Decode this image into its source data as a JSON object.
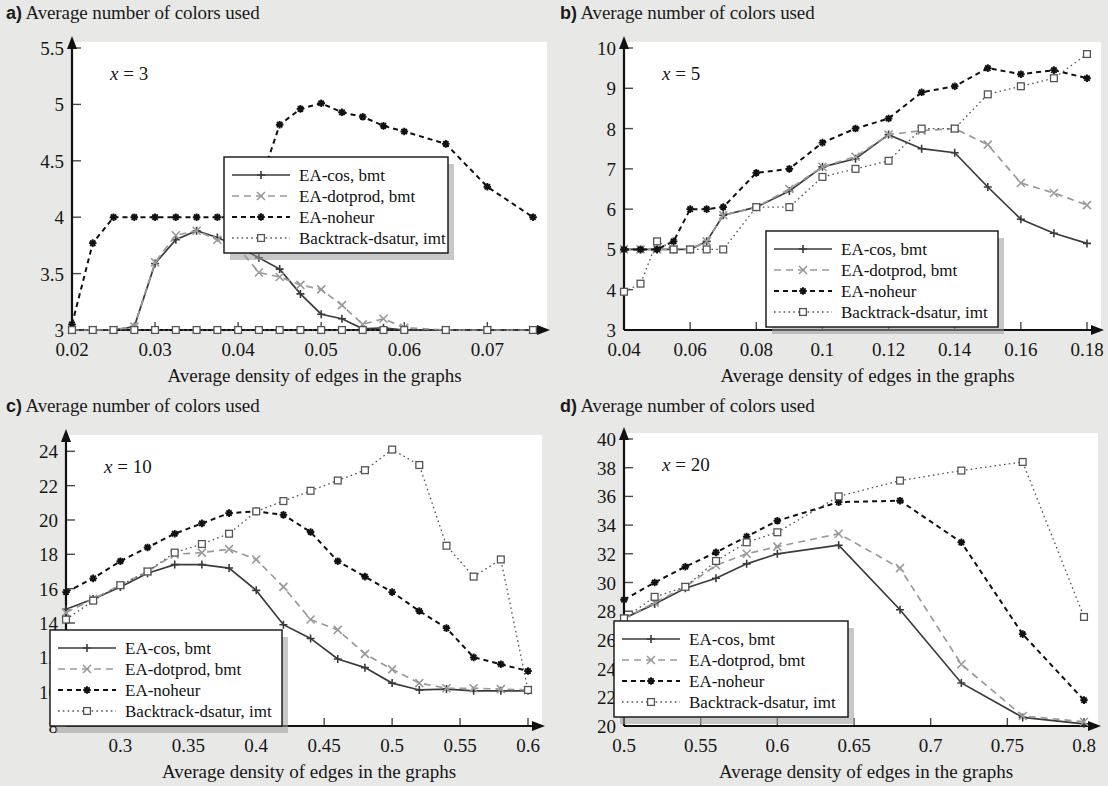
{
  "figure": {
    "background_color": "#e8e8e6",
    "plot_background_color": "#ffffff",
    "axis_caption": "Average density of edges in the graphs",
    "panel_title": "Average number of colors used"
  },
  "series_style": {
    "ea_cos": {
      "label": "EA-cos, bmt",
      "color": "#3b3b3b",
      "marker": "plus",
      "dash": "solid"
    },
    "ea_dotprod": {
      "label": "EA-dotprod, bmt",
      "color": "#9a9a9a",
      "marker": "cross",
      "dash": "dashed"
    },
    "ea_noheur": {
      "label": "EA-noheur",
      "color": "#111111",
      "marker": "asterisk",
      "dash": "dashed"
    },
    "backtrack": {
      "label": "Backtrack-dsatur, imt",
      "color": "#555555",
      "marker": "square",
      "dash": "dotted"
    }
  },
  "panels": [
    {
      "letter": "a)",
      "title": "Average number of colors used",
      "annotation": "x = 3",
      "annotation_var": "x",
      "annotation_val": "= 3"
    },
    {
      "letter": "b)",
      "title": "Average number of colors used",
      "annotation": "x = 5",
      "annotation_var": "x",
      "annotation_val": "= 5"
    },
    {
      "letter": "c)",
      "title": "Average number of colors used",
      "annotation": "x = 10",
      "annotation_var": "x",
      "annotation_val": "= 10"
    },
    {
      "letter": "d)",
      "title": "Average number of colors used",
      "annotation": "x = 20",
      "annotation_var": "x",
      "annotation_val": "= 20"
    }
  ],
  "chart_data": [
    {
      "panel": "a)",
      "type": "line",
      "title": "Average number of colors used",
      "annotation": "x = 3",
      "xlabel": "Average density of edges in the graphs",
      "ylabel": "Average number of colors used",
      "xlim": [
        0.02,
        0.0755
      ],
      "ylim": [
        3,
        5.5
      ],
      "xticks": [
        0.02,
        0.03,
        0.04,
        0.05,
        0.06,
        0.07
      ],
      "xticklabels": [
        "0.02",
        "0.03",
        "0.04",
        "0.05",
        "0.06",
        "0.07"
      ],
      "yticks": [
        3,
        3.5,
        4,
        4.5,
        5,
        5.5
      ],
      "yticklabels": [
        "3",
        "3.5",
        "4",
        "4.5",
        "5",
        "5.5"
      ],
      "grid": false,
      "legend_position": "center-right",
      "series": [
        {
          "name": "EA-cos, bmt",
          "x": [
            0.02,
            0.0225,
            0.025,
            0.0275,
            0.03,
            0.0325,
            0.035,
            0.0375,
            0.04,
            0.0425,
            0.045,
            0.0475,
            0.05,
            0.0525,
            0.055,
            0.0575,
            0.06,
            0.065,
            0.07,
            0.0755
          ],
          "values": [
            3.0,
            3.0,
            3.0,
            3.03,
            3.59,
            3.8,
            3.88,
            3.82,
            3.74,
            3.64,
            3.54,
            3.32,
            3.14,
            3.1,
            3.01,
            3.02,
            3.0,
            3.0,
            3.0,
            3.0
          ]
        },
        {
          "name": "EA-dotprod, bmt",
          "x": [
            0.02,
            0.0225,
            0.025,
            0.0275,
            0.03,
            0.0325,
            0.035,
            0.0375,
            0.04,
            0.0425,
            0.045,
            0.0475,
            0.05,
            0.0525,
            0.055,
            0.0575,
            0.06,
            0.065,
            0.07,
            0.0755
          ],
          "values": [
            3.0,
            3.0,
            3.0,
            3.03,
            3.6,
            3.84,
            3.88,
            3.8,
            3.73,
            3.51,
            3.47,
            3.4,
            3.36,
            3.22,
            3.05,
            3.1,
            3.02,
            3.0,
            3.0,
            3.0
          ]
        },
        {
          "name": "EA-noheur",
          "x": [
            0.02,
            0.0225,
            0.025,
            0.0275,
            0.03,
            0.0325,
            0.035,
            0.0375,
            0.04,
            0.0425,
            0.045,
            0.0475,
            0.05,
            0.0525,
            0.055,
            0.0575,
            0.06,
            0.065,
            0.07,
            0.0755
          ],
          "values": [
            3.05,
            3.77,
            4.0,
            4.0,
            4.0,
            4.0,
            4.0,
            4.0,
            4.0,
            4.27,
            4.82,
            4.96,
            5.01,
            4.93,
            4.89,
            4.81,
            4.76,
            4.65,
            4.27,
            4.0
          ]
        },
        {
          "name": "Backtrack-dsatur, imt",
          "x": [
            0.02,
            0.0225,
            0.025,
            0.0275,
            0.03,
            0.0325,
            0.035,
            0.0375,
            0.04,
            0.0425,
            0.045,
            0.0475,
            0.05,
            0.0525,
            0.055,
            0.0575,
            0.06,
            0.065,
            0.07,
            0.0755
          ],
          "values": [
            3.0,
            3.0,
            3.0,
            3.0,
            3.0,
            3.0,
            3.0,
            3.0,
            3.0,
            3.0,
            3.0,
            3.0,
            3.0,
            3.0,
            3.0,
            3.0,
            3.0,
            3.0,
            3.0,
            3.0
          ]
        }
      ],
      "extra_noheur_tail": {
        "x": [
          0.0755
        ],
        "values": [
          3.82
        ]
      }
    },
    {
      "panel": "b)",
      "type": "line",
      "title": "Average number of colors used",
      "annotation": "x = 5",
      "xlabel": "Average density of edges in the graphs",
      "ylabel": "Average number of colors used",
      "xlim": [
        0.04,
        0.18
      ],
      "ylim": [
        3,
        10
      ],
      "xticks": [
        0.04,
        0.06,
        0.08,
        0.1,
        0.12,
        0.14,
        0.16,
        0.18
      ],
      "xticklabels": [
        "0.04",
        "0.06",
        "0.08",
        "0.1",
        "0.12",
        "0.14",
        "0.16",
        "0.18"
      ],
      "yticks": [
        3,
        4,
        5,
        6,
        7,
        8,
        9,
        10
      ],
      "yticklabels": [
        "3",
        "4",
        "5",
        "6",
        "7",
        "8",
        "9",
        "10"
      ],
      "grid": false,
      "legend_position": "bottom-right",
      "series": [
        {
          "name": "EA-cos, bmt",
          "x": [
            0.04,
            0.045,
            0.05,
            0.055,
            0.06,
            0.065,
            0.07,
            0.08,
            0.09,
            0.1,
            0.11,
            0.12,
            0.13,
            0.14,
            0.15,
            0.16,
            0.17,
            0.18
          ],
          "values": [
            5.0,
            5.0,
            5.0,
            5.0,
            5.0,
            5.2,
            5.85,
            6.05,
            6.45,
            7.05,
            7.25,
            7.85,
            7.5,
            7.4,
            6.55,
            5.75,
            5.4,
            5.15
          ]
        },
        {
          "name": "EA-dotprod, bmt",
          "x": [
            0.04,
            0.045,
            0.05,
            0.055,
            0.06,
            0.065,
            0.07,
            0.08,
            0.09,
            0.1,
            0.11,
            0.12,
            0.13,
            0.14,
            0.15,
            0.16,
            0.17,
            0.18
          ],
          "values": [
            5.0,
            5.0,
            5.0,
            5.0,
            5.0,
            5.2,
            5.85,
            6.05,
            6.5,
            7.05,
            7.3,
            7.85,
            7.95,
            8.0,
            7.6,
            6.65,
            6.4,
            6.1
          ]
        },
        {
          "name": "EA-noheur",
          "x": [
            0.04,
            0.045,
            0.05,
            0.055,
            0.06,
            0.065,
            0.07,
            0.08,
            0.09,
            0.1,
            0.11,
            0.12,
            0.13,
            0.14,
            0.15,
            0.16,
            0.17,
            0.18
          ],
          "values": [
            5.0,
            5.0,
            5.0,
            5.2,
            6.0,
            6.0,
            6.05,
            6.9,
            7.0,
            7.65,
            8.0,
            8.25,
            8.9,
            9.05,
            9.5,
            9.35,
            9.45,
            9.25
          ]
        },
        {
          "name": "Backtrack-dsatur, imt",
          "x": [
            0.04,
            0.045,
            0.05,
            0.055,
            0.06,
            0.065,
            0.07,
            0.08,
            0.09,
            0.1,
            0.11,
            0.12,
            0.13,
            0.14,
            0.15,
            0.16,
            0.17,
            0.18
          ],
          "values": [
            3.95,
            4.15,
            5.2,
            5.0,
            5.0,
            5.0,
            5.0,
            6.05,
            6.05,
            6.8,
            7.0,
            7.2,
            8.0,
            8.0,
            8.85,
            9.05,
            9.25,
            9.85
          ]
        }
      ]
    },
    {
      "panel": "c)",
      "type": "line",
      "title": "Average number of colors used",
      "annotation": "x = 10",
      "xlabel": "Average density of edges in the graphs",
      "ylabel": "Average number of colors used",
      "xlim": [
        0.26,
        0.6
      ],
      "ylim": [
        8,
        24.6
      ],
      "xticks": [
        0.3,
        0.35,
        0.4,
        0.45,
        0.5,
        0.55,
        0.6
      ],
      "xticklabels": [
        "0.3",
        "0.35",
        "0.4",
        "0.45",
        "0.5",
        "0.55",
        "0.6"
      ],
      "yticks": [
        8,
        10,
        12,
        14,
        16,
        18,
        20,
        22,
        24
      ],
      "yticklabels": [
        "8",
        "10",
        "12",
        "14",
        "16",
        "18",
        "20",
        "22",
        "24"
      ],
      "grid": false,
      "legend_position": "bottom-left",
      "series": [
        {
          "name": "EA-cos, bmt",
          "x": [
            0.26,
            0.28,
            0.3,
            0.32,
            0.34,
            0.36,
            0.38,
            0.4,
            0.42,
            0.44,
            0.46,
            0.48,
            0.5,
            0.52,
            0.54,
            0.56,
            0.58,
            0.6
          ],
          "values": [
            14.8,
            15.4,
            16.1,
            16.9,
            17.4,
            17.4,
            17.2,
            15.9,
            13.9,
            13.1,
            11.9,
            11.4,
            10.5,
            10.1,
            10.15,
            10.05,
            10.05,
            10.05
          ]
        },
        {
          "name": "EA-dotprod, bmt",
          "x": [
            0.26,
            0.28,
            0.3,
            0.32,
            0.34,
            0.36,
            0.38,
            0.4,
            0.42,
            0.44,
            0.46,
            0.48,
            0.5,
            0.52,
            0.54,
            0.56,
            0.58,
            0.6
          ],
          "values": [
            14.6,
            15.4,
            16.2,
            17.0,
            18.0,
            18.1,
            18.3,
            17.7,
            16.1,
            14.2,
            13.6,
            12.2,
            11.3,
            10.5,
            10.2,
            10.2,
            10.15,
            10.1
          ]
        },
        {
          "name": "EA-noheur",
          "x": [
            0.26,
            0.28,
            0.3,
            0.32,
            0.34,
            0.36,
            0.38,
            0.4,
            0.42,
            0.44,
            0.46,
            0.48,
            0.5,
            0.52,
            0.54,
            0.56,
            0.58,
            0.6
          ],
          "values": [
            15.8,
            16.6,
            17.6,
            18.4,
            19.2,
            19.8,
            20.4,
            20.5,
            20.3,
            19.3,
            17.6,
            16.7,
            15.8,
            14.7,
            13.7,
            12.0,
            11.6,
            11.2
          ]
        },
        {
          "name": "Backtrack-dsatur, imt",
          "x": [
            0.26,
            0.28,
            0.3,
            0.32,
            0.34,
            0.36,
            0.38,
            0.4,
            0.42,
            0.44,
            0.46,
            0.48,
            0.5,
            0.52,
            0.54,
            0.56,
            0.58,
            0.6
          ],
          "values": [
            14.2,
            15.3,
            16.2,
            17.0,
            18.1,
            18.6,
            19.2,
            20.5,
            21.1,
            21.7,
            22.3,
            22.9,
            24.1,
            23.2,
            18.5,
            16.7,
            17.7,
            10.1
          ]
        }
      ]
    },
    {
      "panel": "d)",
      "type": "line",
      "title": "Average number of colors used",
      "annotation": "x = 20",
      "xlabel": "Average density of edges in the graphs",
      "ylabel": "Average number of colors used",
      "xlim": [
        0.5,
        0.8
      ],
      "ylim": [
        20,
        40
      ],
      "xticks": [
        0.5,
        0.55,
        0.6,
        0.65,
        0.7,
        0.75,
        0.8
      ],
      "xticklabels": [
        "0.5",
        "0.55",
        "0.6",
        "0.65",
        "0.7",
        "0.75",
        "0.8"
      ],
      "yticks": [
        20,
        22,
        24,
        26,
        28,
        30,
        32,
        34,
        36,
        38,
        40
      ],
      "yticklabels": [
        "20",
        "22",
        "24",
        "26",
        "28",
        "30",
        "32",
        "34",
        "36",
        "38",
        "40"
      ],
      "grid": false,
      "legend_position": "bottom-left",
      "series": [
        {
          "name": "EA-cos, bmt",
          "x": [
            0.5,
            0.52,
            0.54,
            0.56,
            0.58,
            0.6,
            0.64,
            0.68,
            0.72,
            0.76,
            0.8
          ],
          "values": [
            27.5,
            28.5,
            29.6,
            30.3,
            31.3,
            32.0,
            32.6,
            28.1,
            23.0,
            20.6,
            20.15
          ]
        },
        {
          "name": "EA-dotprod, bmt",
          "x": [
            0.5,
            0.52,
            0.54,
            0.56,
            0.58,
            0.6,
            0.64,
            0.68,
            0.72,
            0.76,
            0.8
          ],
          "values": [
            27.5,
            28.6,
            29.7,
            31.2,
            32.0,
            32.5,
            33.4,
            31.0,
            24.3,
            20.7,
            20.3
          ]
        },
        {
          "name": "EA-noheur",
          "x": [
            0.5,
            0.52,
            0.54,
            0.56,
            0.58,
            0.6,
            0.64,
            0.68,
            0.72,
            0.76,
            0.8
          ],
          "values": [
            28.8,
            30.0,
            31.1,
            32.1,
            33.2,
            34.3,
            35.6,
            35.7,
            32.8,
            26.4,
            21.8
          ]
        },
        {
          "name": "Backtrack-dsatur, imt",
          "x": [
            0.5,
            0.52,
            0.54,
            0.56,
            0.58,
            0.6,
            0.64,
            0.68,
            0.72,
            0.76,
            0.8
          ],
          "values": [
            27.5,
            29.0,
            29.7,
            31.5,
            32.8,
            33.5,
            36.0,
            37.1,
            37.8,
            38.4,
            27.6
          ]
        }
      ]
    }
  ]
}
